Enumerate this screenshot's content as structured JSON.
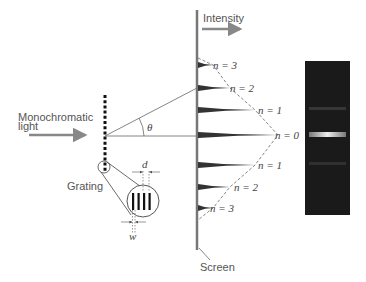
{
  "diagram": {
    "labels": {
      "intensity": "Intensity",
      "monochromatic_line1": "Monochromatic",
      "monochromatic_line2": "light",
      "theta": "θ",
      "grating": "Grating",
      "screen": "Screen",
      "slit_spacing": "d",
      "slit_width": "w"
    },
    "orders": [
      {
        "label": "n = 3",
        "y": 65,
        "length": 14
      },
      {
        "label": "n = 2",
        "y": 88,
        "length": 32
      },
      {
        "label": "n = 1",
        "y": 110,
        "length": 57
      },
      {
        "label": "n = 0",
        "y": 135,
        "length": 80
      },
      {
        "label": "n = 1",
        "y": 165,
        "length": 57
      },
      {
        "label": "n = 2",
        "y": 187,
        "length": 32
      },
      {
        "label": "n = 3",
        "y": 208,
        "length": 14
      }
    ],
    "photo": {
      "bands": [
        {
          "order": 0,
          "brightness": "bright"
        },
        {
          "order": 1,
          "brightness": "faint"
        },
        {
          "order": -1,
          "brightness": "faint"
        }
      ]
    },
    "colors": {
      "arrow": "#888888",
      "screen": "#777777",
      "peaks": "#333333",
      "photo_bg": "#1a1a1a"
    }
  }
}
